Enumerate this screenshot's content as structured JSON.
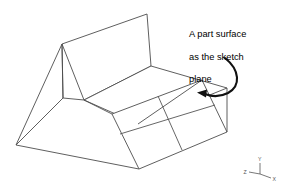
{
  "figure": {
    "title": "A part surface as the sketch plane",
    "background_color": "#ffffff",
    "line_color": "#4d4d4d",
    "arrow_color": "#111111",
    "callout": {
      "lines": [
        "A part surface",
        "as the sketch",
        "plane"
      ],
      "full_text": "A part surface as the sketch plane"
    },
    "arrow": {
      "name": "callout-arrow",
      "description": "curved arrow pointing from the callout text down-left to the inclined sketch face",
      "target": "inclined-sketch-face"
    },
    "solid": {
      "name": "wedge-part",
      "faces": [
        {
          "name": "back-panel",
          "vertices": "62,44 147,14 151,66 84,100"
        },
        {
          "name": "seat-top-face",
          "vertices": "84,100 151,66 227,88 138,124"
        },
        {
          "name": "left-triangular-face",
          "vertices": "62,44 63,98 16,145"
        },
        {
          "name": "inclined-sketch-face",
          "vertices": "112,114 202,80 227,132 139,169"
        },
        {
          "name": "front-base-edge",
          "vertices": "16,145 139,169"
        }
      ]
    },
    "sketch": {
      "name": "sketch-grid",
      "rows": 2,
      "columns": 2,
      "cells": 4,
      "divider_lines": [
        {
          "name": "sketch-divider-horizontal",
          "from": "120,134",
          "to": "215,105"
        },
        {
          "name": "sketch-divider-vertical",
          "from": "158,96",
          "to": "182,150"
        }
      ]
    },
    "triad": {
      "name": "axis-triad",
      "origin": "260,174",
      "axes": [
        {
          "label": "Y",
          "direction": "up"
        },
        {
          "label": "X",
          "direction": "right-down"
        },
        {
          "label": "Z",
          "direction": "left"
        }
      ]
    }
  }
}
